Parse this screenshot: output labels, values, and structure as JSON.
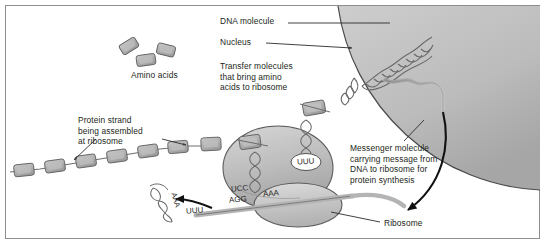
{
  "figure": {
    "background_color": "#ffffff",
    "border_color": "#8d8d8d"
  },
  "labels": {
    "dna_molecule": "DNA molecule",
    "nucleus": "Nucleus",
    "transfer_molecules": "Transfer molecules\nthat bring amino\nacids to ribosome",
    "amino_acids": "Amino acids",
    "protein_strand": "Protein strand\nbeing assembled\nat ribosome",
    "messenger_molecule": "Messenger molecule\ncarrying message from\nDNA to ribosome for\nprotein synthesis",
    "ribosome": "Ribosome"
  },
  "codons": {
    "trna_top_anticodon": "UUU",
    "trna_left_anticodon": "UCC",
    "mrna_codon_1": "AGG",
    "mrna_codon_2": "AAA",
    "mrna_codon_3": "UUU",
    "trna_released_anticodon": "AAA"
  },
  "colors": {
    "nucleus_fill_light": "#cfcfcf",
    "nucleus_fill_dark": "#a8a8a8",
    "ribosome_fill": "#b9b9b9",
    "ribosome_fill_light": "#d2d2d2",
    "amino_acid_fill": "#b0b0b0",
    "strand_color": "#6e6e6e",
    "arrow_color": "#111111",
    "text_color": "#231f20"
  },
  "elements": {
    "amino_acid_free_count": 3,
    "protein_strand_bead_count": 7,
    "nucleus_shape": "quarter-circle",
    "ribosome_shape": "large-oval-with-lower-lobe"
  }
}
